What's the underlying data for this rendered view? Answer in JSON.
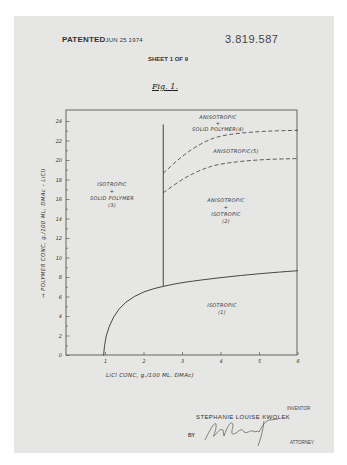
{
  "header": {
    "patented_label": "PATENTED",
    "patented_date": "JUN 25 1974",
    "patent_number": "3.819.587",
    "sheet": "SHEET 1 OF 9",
    "figure_label": "Fig. 1."
  },
  "chart_data": {
    "type": "line",
    "xlabel": "LiCl CONC, g./100 ML. DMAc",
    "ylabel": "POLYMER CONC, g./100 ML. DMAc - LiCl",
    "xlim": [
      0,
      6
    ],
    "ylim": [
      0,
      25.2
    ],
    "x_ticks": [
      "1",
      "2",
      "3",
      "4",
      "5",
      "6"
    ],
    "y_ticks": [
      "0",
      "2",
      "4",
      "6",
      "8",
      "10",
      "12",
      "14",
      "16",
      "18",
      "20",
      "22",
      "24"
    ],
    "grid": false,
    "legend": null,
    "series": [
      {
        "name": "isotropic boundary (solid)",
        "style": "solid",
        "x": [
          0.95,
          1.0,
          1.2,
          1.5,
          2.0,
          2.5,
          3.0,
          4.0,
          5.0,
          6.0
        ],
        "y": [
          0.0,
          2.0,
          4.0,
          5.5,
          6.6,
          7.1,
          7.5,
          8.0,
          8.4,
          8.7
        ]
      },
      {
        "name": "vertical boundary (solid)",
        "style": "solid",
        "x": [
          2.5,
          2.5
        ],
        "y": [
          7.1,
          23.7
        ]
      },
      {
        "name": "upper dashed boundary",
        "style": "dashed",
        "x": [
          2.5,
          3.0,
          3.5,
          4.0,
          5.0,
          6.0
        ],
        "y": [
          18.7,
          20.5,
          21.8,
          22.6,
          23.0,
          23.1
        ]
      },
      {
        "name": "lower dashed boundary",
        "style": "dashed",
        "x": [
          2.5,
          3.0,
          3.5,
          4.0,
          5.0,
          6.0
        ],
        "y": [
          16.7,
          18.1,
          19.1,
          19.7,
          20.1,
          20.2
        ]
      }
    ],
    "annotations": [
      {
        "text": "ISOTROPIC + SOLID POLYMER (3)",
        "x": 1.3,
        "y": 16.3
      },
      {
        "text": "ANISOTROPIC + SOLID POLYMER (4)",
        "x": 4.5,
        "y": 24.2
      },
      {
        "text": "ANISOTROPIC (5)",
        "x": 4.6,
        "y": 21.6
      },
      {
        "text": "ANISOTROPIC + ISOTROPIC (2)",
        "x": 4.2,
        "y": 14.5
      },
      {
        "text": "ISOTROPIC (1)",
        "x": 4.5,
        "y": 4.7
      }
    ]
  },
  "regions": {
    "r3": [
      "ISOTROPIC",
      "+",
      "SOLID POLYMER",
      "(3)"
    ],
    "r4": [
      "ANISOTROPIC",
      "+",
      "SOLID POLYMER(4)"
    ],
    "r5": [
      "ANISOTROPIC(5)"
    ],
    "r2": [
      "ANISOTROPIC",
      "+",
      "ISOTROPIC",
      "(2)"
    ],
    "r1": [
      "ISOTROPIC",
      "(1)"
    ]
  },
  "axes": {
    "xlabel": "LiCl CONC, g./100 ML. DMAc)",
    "ylabel": "→ POLYMER CONC, g./100 ML. DMAc – LiCl)"
  },
  "footer": {
    "inventor_caption": "INVENTOR",
    "inventor_name": "STEPHANIE LOUISE KWOLEK",
    "by": "BY",
    "signature": "Sol Schwartz",
    "attorney_caption": "ATTORNEY"
  }
}
